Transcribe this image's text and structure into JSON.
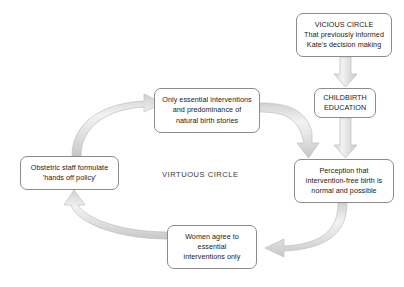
{
  "diagram": {
    "center_label": "VIRTUOUS CIRCLE",
    "colors": {
      "background": "#ffffff",
      "box_border": "#8c8c8c",
      "box_fill": "#ffffff",
      "text": "#1a1a1a",
      "arrow_fill": "#e3e3e3",
      "arrow_stroke": "#b5b5b5",
      "center_label_text": "#3a3a3a"
    },
    "nodes": [
      {
        "id": "vicious-circle",
        "text": "VICIOUS CIRCLE\nThat previously informed\nKate's decision making"
      },
      {
        "id": "childbirth-education",
        "text": "CHILDBIRTH\nEDUCATION"
      },
      {
        "id": "perception",
        "text": "Perception that\nintervention-free birth is\nnormal and possible"
      },
      {
        "id": "only-essential",
        "text": "Only essential interventions\nand predominance of\nnatural birth stories"
      },
      {
        "id": "obstetric-staff",
        "text": "Obstetric staff formulate\n'hands off policy'"
      },
      {
        "id": "women-agree",
        "text": "Women agree to\nessential\ninterventions only"
      }
    ],
    "edges": [
      {
        "id": "vicious-to-childbirth",
        "from": "vicious-circle",
        "to": "childbirth-education",
        "style": "straight-down"
      },
      {
        "id": "childbirth-to-perception",
        "from": "childbirth-education",
        "to": "perception",
        "style": "straight-down"
      },
      {
        "id": "onlyessential-to-perception",
        "from": "only-essential",
        "to": "perception",
        "style": "curved-right-down"
      },
      {
        "id": "perception-to-womenagree",
        "from": "perception",
        "to": "women-agree",
        "style": "curved-down-left"
      },
      {
        "id": "womenagree-to-obstetric",
        "from": "women-agree",
        "to": "obstetric-staff",
        "style": "curved-left-up"
      },
      {
        "id": "obstetric-to-onlyessential",
        "from": "obstetric-staff",
        "to": "only-essential",
        "style": "curved-up-right"
      }
    ]
  }
}
